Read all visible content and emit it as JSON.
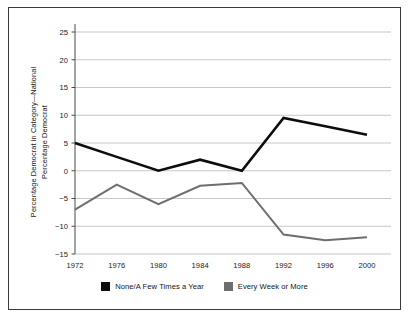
{
  "chart_data": {
    "type": "line",
    "title": "",
    "xlabel": "",
    "ylabel": "Percentage Democrat in Category—National Percentage Democrat",
    "ylabel_lines": [
      "Percentage Democrat in Category—National",
      "Percentage Democrat"
    ],
    "categories": [
      "1972",
      "1976",
      "1980",
      "1984",
      "1988",
      "1992",
      "1996",
      "2000"
    ],
    "x": [
      1972,
      1976,
      1980,
      1984,
      1988,
      1992,
      1996,
      2000
    ],
    "xlim": [
      1972,
      2000
    ],
    "ylim": [
      -15,
      25
    ],
    "yticks": [
      -15,
      -10,
      -5,
      0,
      5,
      10,
      15,
      20,
      25
    ],
    "ytick_labels": [
      "−15",
      "−10",
      "−5",
      "0",
      "5",
      "10",
      "15",
      "20",
      "25"
    ],
    "grid": "horizontal",
    "legend_position": "bottom-center",
    "series": [
      {
        "name": "None/A Few Times a Year",
        "color": "#0d0d0d",
        "values": [
          5,
          2.5,
          0,
          2,
          0,
          9.5,
          8,
          6.5
        ]
      },
      {
        "name": "Every Week or More",
        "color": "#6e6e6e",
        "values": [
          -7,
          -2.5,
          -6,
          -2.7,
          -2.2,
          -11.5,
          -12.5,
          -12
        ]
      }
    ]
  },
  "legend": {
    "items": [
      {
        "label": "None/A Few Times a Year",
        "color": "#0d0d0d"
      },
      {
        "label": "Every Week or More",
        "color": "#6e6e6e"
      }
    ]
  },
  "colors": {
    "series_black": "#0d0d0d",
    "series_gray": "#6e6e6e",
    "grid": "#b9b9b9",
    "axis": "#4a4a4a",
    "border": "#3a3a3a",
    "text": "#1a1a1a"
  }
}
